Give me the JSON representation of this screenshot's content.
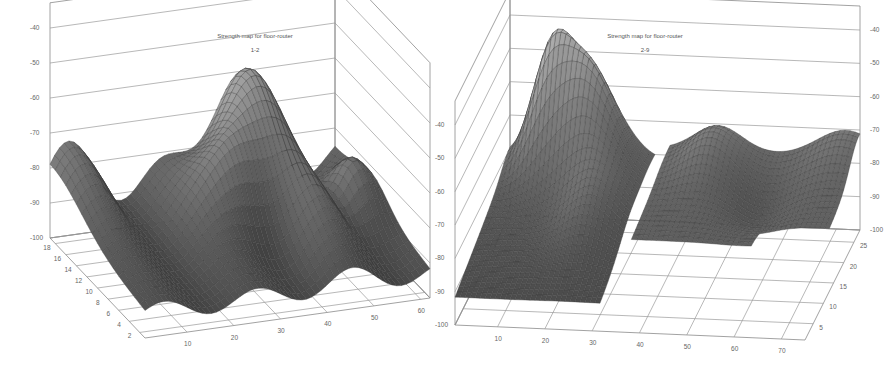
{
  "chart_data": [
    {
      "type": "surface3d",
      "title": "Strength map for floor-router",
      "subtitle": "1-2",
      "xlabel": "",
      "ylabel": "",
      "zlabel": "",
      "x_ticks": [
        10,
        20,
        30,
        40,
        50,
        60
      ],
      "y_ticks": [
        2,
        4,
        6,
        8,
        10,
        12,
        14,
        16,
        18
      ],
      "z_ticks": [
        -40,
        -50,
        -60,
        -70,
        -80,
        -90,
        -100
      ],
      "xlim": [
        1,
        62
      ],
      "ylim": [
        1,
        19
      ],
      "zlim": [
        -100,
        -40
      ],
      "grid": true,
      "colormap": "grayscale",
      "surface_description": "Undulating signal-strength surface: low (~-90 to -95 dBm) along y≈2-6, ridge peaking near x≈40,y≈17 at about -60, secondary bump near x≈58,y≈12 (~-75), valleys of ~-90 along x≈8,22,34",
      "approx_peaks": [
        {
          "x": 40,
          "y": 17,
          "z": -60
        },
        {
          "x": 33,
          "y": 12,
          "z": -70
        },
        {
          "x": 58,
          "y": 12,
          "z": -75
        },
        {
          "x": 5,
          "y": 18,
          "z": -82
        }
      ]
    },
    {
      "type": "surface3d",
      "title": "Strength map for floor-router",
      "subtitle": "2-9",
      "xlabel": "",
      "ylabel": "",
      "zlabel": "",
      "x_ticks": [
        10,
        20,
        30,
        40,
        50,
        60,
        70
      ],
      "y_ticks": [
        5,
        10,
        15,
        20,
        25
      ],
      "z_ticks": [
        -40,
        -50,
        -60,
        -70,
        -80,
        -90,
        -100
      ],
      "xlim": [
        1,
        75
      ],
      "ylim": [
        1,
        28
      ],
      "zlim": [
        -100,
        -40
      ],
      "grid": true,
      "colormap": "grayscale",
      "surface_description": "Two disjoint regions: left region (x≈1-32) rising from ~-90 to a ridge of ~-55 near x≈18,y≈25; right region (x≈35-75, y≈10-28) flatter at ~-75 to -85 with a mild bump near x≈45,y≈25 (~-72)",
      "approx_peaks": [
        {
          "x": 18,
          "y": 25,
          "z": -55
        },
        {
          "x": 10,
          "y": 27,
          "z": -58
        },
        {
          "x": 45,
          "y": 25,
          "z": -72
        },
        {
          "x": 73,
          "y": 27,
          "z": -75
        }
      ]
    }
  ]
}
